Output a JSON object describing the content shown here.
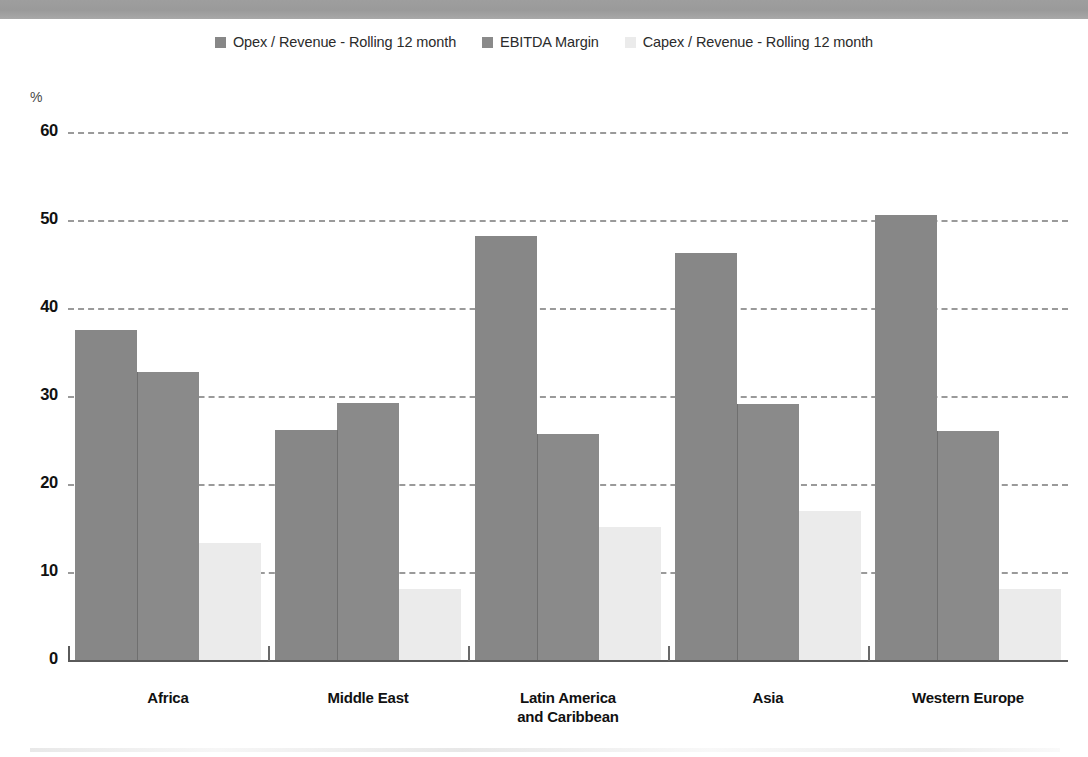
{
  "header": {
    "band_color": "#9e9e9e"
  },
  "legend": {
    "items": [
      {
        "label": "Opex / Revenue - Rolling 12 month",
        "color": "#878787",
        "swatch_icon": "square-swatch-icon"
      },
      {
        "label": "EBITDA Margin",
        "color": "#8a8a8a",
        "swatch_icon": "square-swatch-icon"
      },
      {
        "label": "Capex / Revenue - Rolling 12 month",
        "color": "#ebebeb",
        "swatch_icon": "square-swatch-icon"
      }
    ]
  },
  "chart_data": {
    "type": "bar",
    "title": "",
    "xlabel": "",
    "ylabel": "%",
    "unit_label": "%",
    "ylim": [
      0,
      60
    ],
    "yticks": [
      0,
      10,
      20,
      30,
      40,
      50,
      60
    ],
    "ytick_labels": [
      "0",
      "10",
      "20",
      "30",
      "40",
      "50",
      "60"
    ],
    "grid": true,
    "grid_style": "dashed-horizontal",
    "legend_position": "top-center",
    "categories": [
      "Africa",
      "Middle East",
      "Latin America and Caribbean",
      "Asia",
      "Western Europe"
    ],
    "category_label_lines": [
      [
        "Africa"
      ],
      [
        "Middle East"
      ],
      [
        "Latin America",
        "and Caribbean"
      ],
      [
        "Asia"
      ],
      [
        "Western Europe"
      ]
    ],
    "series": [
      {
        "name": "Opex / Revenue - Rolling 12 month",
        "color": "#878787",
        "values": [
          37.5,
          26.1,
          48.2,
          46.2,
          50.6
        ]
      },
      {
        "name": "EBITDA Margin",
        "color": "#8a8a8a",
        "values": [
          32.7,
          29.2,
          25.7,
          29.1,
          26.0
        ]
      },
      {
        "name": "Capex / Revenue - Rolling 12 month",
        "color": "#ebebeb",
        "values": [
          13.3,
          8.1,
          15.1,
          16.9,
          8.1
        ]
      }
    ]
  }
}
